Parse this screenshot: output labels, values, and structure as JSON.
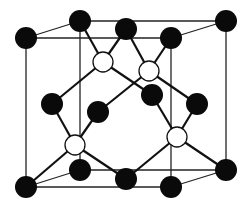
{
  "diagram": {
    "type": "crystal-lattice-unit-cell",
    "colors": {
      "dark_atom": "#0a0a0a",
      "light_atom": "#ffffff",
      "line": "#111111",
      "background": "#ffffff"
    },
    "cube_edges": [
      [
        26,
        38,
        171,
        38
      ],
      [
        171,
        38,
        171,
        187
      ],
      [
        171,
        187,
        26,
        187
      ],
      [
        26,
        187,
        26,
        38
      ],
      [
        80,
        21,
        226,
        21
      ],
      [
        226,
        21,
        226,
        170
      ],
      [
        226,
        170,
        80,
        170
      ],
      [
        80,
        170,
        80,
        21
      ],
      [
        26,
        38,
        80,
        21
      ],
      [
        171,
        38,
        226,
        21
      ],
      [
        171,
        187,
        226,
        170
      ],
      [
        26,
        187,
        80,
        170
      ]
    ],
    "dark_atoms": [
      {
        "id": "corner-front-top-left",
        "x": 26,
        "y": 38,
        "r": 11
      },
      {
        "id": "corner-back-top-left",
        "x": 80,
        "y": 21,
        "r": 11
      },
      {
        "id": "face-top-center",
        "x": 126,
        "y": 29,
        "r": 11
      },
      {
        "id": "corner-front-top-right",
        "x": 171,
        "y": 38,
        "r": 11
      },
      {
        "id": "corner-back-top-right",
        "x": 226,
        "y": 21,
        "r": 11
      },
      {
        "id": "face-left-center",
        "x": 52,
        "y": 104,
        "r": 11
      },
      {
        "id": "face-front-center",
        "x": 98,
        "y": 112,
        "r": 11
      },
      {
        "id": "face-back-center",
        "x": 152,
        "y": 95,
        "r": 11
      },
      {
        "id": "face-right-center",
        "x": 197,
        "y": 104,
        "r": 11
      },
      {
        "id": "corner-front-bottom-left",
        "x": 26,
        "y": 187,
        "r": 11
      },
      {
        "id": "corner-back-bottom-left",
        "x": 80,
        "y": 170,
        "r": 11
      },
      {
        "id": "face-bottom-center",
        "x": 126,
        "y": 179,
        "r": 11
      },
      {
        "id": "corner-front-bottom-right",
        "x": 171,
        "y": 187,
        "r": 11
      },
      {
        "id": "corner-back-bottom-right",
        "x": 226,
        "y": 170,
        "r": 11
      }
    ],
    "light_atoms": [
      {
        "id": "tetra-1",
        "x": 103,
        "y": 62,
        "r": 10
      },
      {
        "id": "tetra-2",
        "x": 149,
        "y": 71,
        "r": 10
      },
      {
        "id": "tetra-3",
        "x": 75,
        "y": 145,
        "r": 10
      },
      {
        "id": "tetra-4",
        "x": 177,
        "y": 137,
        "r": 10
      }
    ],
    "bonds": [
      [
        103,
        62,
        80,
        21
      ],
      [
        103,
        62,
        126,
        29
      ],
      [
        103,
        62,
        52,
        104
      ],
      [
        103,
        62,
        152,
        95
      ],
      [
        149,
        71,
        126,
        29
      ],
      [
        149,
        71,
        171,
        38
      ],
      [
        149,
        71,
        98,
        112
      ],
      [
        149,
        71,
        197,
        104
      ],
      [
        75,
        145,
        52,
        104
      ],
      [
        75,
        145,
        98,
        112
      ],
      [
        75,
        145,
        26,
        187
      ],
      [
        75,
        145,
        126,
        179
      ],
      [
        177,
        137,
        152,
        95
      ],
      [
        177,
        137,
        197,
        104
      ],
      [
        177,
        137,
        126,
        179
      ],
      [
        177,
        137,
        226,
        170
      ]
    ]
  }
}
